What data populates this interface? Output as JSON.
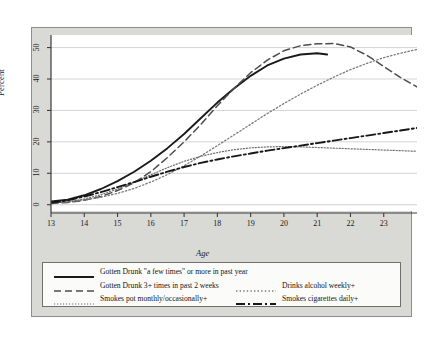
{
  "chart_data": {
    "type": "line",
    "title": "",
    "xlabel": "Age",
    "ylabel": "Percent",
    "xlim": [
      13,
      24
    ],
    "ylim": [
      -2,
      54
    ],
    "xticks": [
      13,
      14,
      15,
      16,
      17,
      18,
      19,
      20,
      21,
      22,
      23
    ],
    "yticks": [
      0,
      10,
      20,
      30,
      40,
      50
    ],
    "grid": "horizontal",
    "legend_position": "bottom",
    "series": [
      {
        "name": "Gotten Drunk \"a few times\" or more in past year",
        "style": "solid",
        "color": "#1a1a1a",
        "width": 1.9,
        "x": [
          13.0,
          13.5,
          14.0,
          14.5,
          15.0,
          15.5,
          16.0,
          16.5,
          17.0,
          17.5,
          18.0,
          18.5,
          19.0,
          19.5,
          20.0,
          20.5,
          21.0,
          21.3
        ],
        "y": [
          1.0,
          1.6,
          3.0,
          5.0,
          7.5,
          10.5,
          14.0,
          18.0,
          22.5,
          27.5,
          32.5,
          37.0,
          41.0,
          44.3,
          46.5,
          47.8,
          48.2,
          47.8
        ]
      },
      {
        "name": "Gotten Drunk 3+ times in past 2 weeks",
        "style": "dashed",
        "color": "#4d4d4d",
        "width": 1.5,
        "x": [
          13.0,
          13.5,
          14.0,
          14.5,
          15.0,
          15.5,
          16.0,
          16.5,
          17.0,
          17.5,
          18.0,
          18.5,
          19.0,
          19.5,
          20.0,
          20.5,
          21.0,
          21.5,
          22.0,
          22.5,
          23.0,
          23.5,
          24.0
        ],
        "y": [
          0.4,
          0.7,
          1.4,
          2.6,
          4.5,
          7.0,
          10.5,
          15.0,
          20.0,
          25.5,
          31.5,
          37.0,
          42.0,
          46.0,
          49.0,
          50.6,
          51.2,
          51.3,
          50.2,
          47.5,
          44.0,
          40.5,
          37.5
        ]
      },
      {
        "name": "Drinks alcohol weekly+",
        "style": "dotted",
        "color": "#7a7a7a",
        "width": 1.3,
        "x": [
          13.0,
          13.5,
          14.0,
          14.5,
          15.0,
          15.5,
          16.0,
          16.5,
          17.0,
          17.5,
          18.0,
          18.5,
          19.0,
          19.5,
          20.0,
          20.5,
          21.0,
          21.5,
          22.0,
          22.5,
          23.0,
          23.5,
          24.0
        ],
        "y": [
          0.6,
          0.9,
          1.5,
          2.4,
          3.6,
          5.2,
          7.2,
          9.6,
          12.4,
          15.5,
          18.8,
          22.2,
          25.6,
          29.0,
          32.2,
          35.2,
          38.0,
          40.6,
          43.0,
          45.0,
          46.8,
          48.2,
          49.4
        ]
      },
      {
        "name": "Smokes pot monthly/occasionally+",
        "style": "fine-dotted",
        "color": "#6e6e6e",
        "width": 1.2,
        "x": [
          13.0,
          13.5,
          14.0,
          14.5,
          15.0,
          15.5,
          16.0,
          16.5,
          17.0,
          17.5,
          18.0,
          18.5,
          19.0,
          19.5,
          20.0,
          20.5,
          21.0,
          21.5,
          22.0,
          22.5,
          23.0,
          23.5,
          24.0
        ],
        "y": [
          0.5,
          0.9,
          1.8,
          3.2,
          5.0,
          7.2,
          9.5,
          11.8,
          13.8,
          15.4,
          16.6,
          17.5,
          18.1,
          18.4,
          18.5,
          18.4,
          18.2,
          18.0,
          17.8,
          17.6,
          17.4,
          17.2,
          17.0
        ]
      },
      {
        "name": "Smokes cigarettes daily+",
        "style": "dash-dot",
        "color": "#171717",
        "width": 1.9,
        "x": [
          13.0,
          13.5,
          14.0,
          14.5,
          15.0,
          15.5,
          16.0,
          16.5,
          17.0,
          17.5,
          18.0,
          18.5,
          19.0,
          19.5,
          20.0,
          20.5,
          21.0,
          21.5,
          22.0,
          22.5,
          23.0,
          23.5,
          24.0
        ],
        "y": [
          0.6,
          1.4,
          2.6,
          4.0,
          5.6,
          7.2,
          8.9,
          10.5,
          12.0,
          13.3,
          14.4,
          15.4,
          16.3,
          17.2,
          18.0,
          18.8,
          19.6,
          20.4,
          21.2,
          22.0,
          22.8,
          23.6,
          24.4
        ]
      }
    ]
  },
  "axes": {
    "ylabel": "Percent",
    "xlabel": "Age",
    "yticklabels": [
      "0",
      "10",
      "20",
      "30",
      "40",
      "50"
    ],
    "xticklabels": [
      "13",
      "14",
      "15",
      "16",
      "17",
      "18",
      "19",
      "20",
      "21",
      "22",
      "23"
    ]
  },
  "legend": {
    "entries": [
      {
        "label": "Gotten Drunk \"a few times\" or more in past year",
        "style": "solid"
      },
      {
        "label": "Gotten Drunk 3+ times in past 2 weeks",
        "style": "dashed"
      },
      {
        "label": "Drinks alcohol weekly+",
        "style": "dotted"
      },
      {
        "label": "Smokes pot monthly/occasionally+",
        "style": "fine-dotted"
      },
      {
        "label": "Smokes cigarettes daily+",
        "style": "dash-dot"
      }
    ]
  },
  "colors": {
    "panel_background": "#ffffff",
    "card_background": "#d9d9d6",
    "gridline": "#c8c8c8",
    "axis": "#3c3c3c"
  }
}
